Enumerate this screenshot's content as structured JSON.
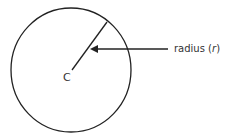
{
  "diagram": {
    "type": "circle-radius",
    "center_label": "C",
    "radius_label": {
      "prefix": "radius (",
      "symbol": "r",
      "suffix": ")"
    },
    "colors": {
      "stroke": "#222222",
      "text": "#333333",
      "background": "#ffffff"
    }
  }
}
